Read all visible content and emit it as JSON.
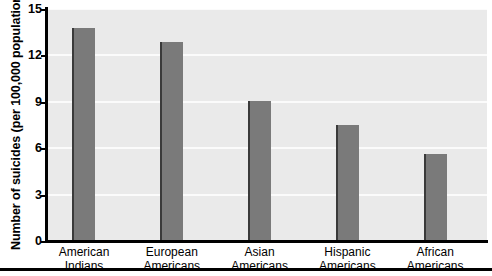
{
  "chart_data": {
    "type": "bar",
    "title": "",
    "xlabel": "",
    "ylabel": "Number of suicides (per 100,000 population)",
    "categories": [
      "American Indians",
      "European Americans",
      "Asian Americans",
      "Hispanic Americans",
      "African Americans"
    ],
    "category_lines": [
      [
        "American",
        "Indians"
      ],
      [
        "European",
        "Americans"
      ],
      [
        "Asian",
        "Americans"
      ],
      [
        "Hispanic",
        "Americans"
      ],
      [
        "African",
        "Americans"
      ]
    ],
    "values": [
      13.75,
      12.85,
      9.05,
      7.5,
      5.6
    ],
    "ylim": [
      0,
      15
    ],
    "yticks": [
      0,
      3,
      6,
      9,
      12,
      15
    ],
    "ytick_labels": [
      "0",
      "3",
      "6",
      "9",
      "12",
      "15"
    ],
    "grid": true,
    "legend": false,
    "colors": {
      "bar_fill": "#7a7a7a",
      "bar_edge": "#3a3a3a",
      "plot_background": "#eaeaea",
      "gridline": "#fbfbfb",
      "axis": "#000000",
      "text": "#000000",
      "page_background": "#ffffff"
    }
  }
}
